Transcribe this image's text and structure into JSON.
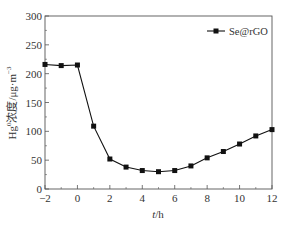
{
  "chart_data": {
    "type": "line",
    "title": "",
    "xlabel": "t/h",
    "ylabel": "Hg⁰浓度/μg·m⁻³",
    "xlim": [
      -2,
      12
    ],
    "ylim": [
      0,
      300
    ],
    "xticks": [
      -2,
      0,
      2,
      4,
      6,
      8,
      10,
      12
    ],
    "yticks": [
      0,
      50,
      100,
      150,
      200,
      250,
      300
    ],
    "grid": false,
    "legend_position": "top-right",
    "x": [
      -2,
      -1,
      0,
      1,
      2,
      3,
      4,
      5,
      6,
      7,
      8,
      9,
      10,
      11,
      12
    ],
    "series": [
      {
        "name": "Se@rGO",
        "marker": "square",
        "color": "#111111",
        "values": [
          216,
          214,
          215,
          109,
          52,
          38,
          32,
          30,
          32,
          40,
          54,
          65,
          78,
          92,
          103
        ]
      }
    ]
  },
  "labels": {
    "xlabel_italic": "t",
    "xlabel_rest": "/h",
    "ylabel_hg": "Hg",
    "ylabel_sup": "0",
    "ylabel_mid": "浓度/μg·m",
    "ylabel_sup2": "−3",
    "legend": "Se@rGO"
  }
}
